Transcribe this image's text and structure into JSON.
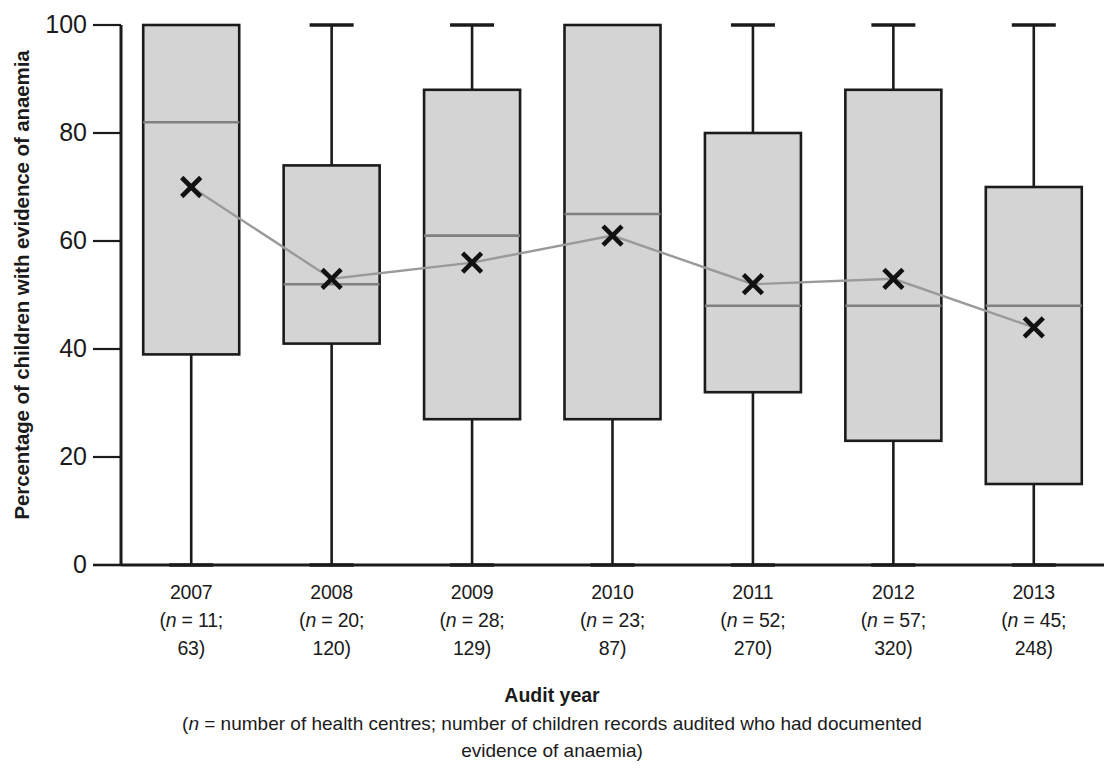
{
  "chart_data": {
    "type": "box",
    "title": "",
    "ylabel": "Percentage of children with evidence of anaemia",
    "xlabel": "Audit year",
    "xlabel_note_prefix": "(",
    "xlabel_note_italic": "n",
    "xlabel_note_rest": " = number of health centres; number of children records audited who had documented",
    "xlabel_note_line2": "evidence of anaemia)",
    "ylim": [
      0,
      100
    ],
    "yticks": [
      0,
      20,
      40,
      60,
      80,
      100
    ],
    "ytick_labels": [
      "0",
      "20",
      "40",
      "60",
      "80",
      "100"
    ],
    "grid": false,
    "legend": "none",
    "mean_marker": "x",
    "mean_line": true,
    "box_fill": "#d4d4d4",
    "box_stroke": "#1b1b1b",
    "median_color": "#808080",
    "mean_line_color": "#9a9a9a",
    "categories": [
      "2007",
      "2008",
      "2009",
      "2010",
      "2011",
      "2012",
      "2013"
    ],
    "n_health_centres": [
      11,
      20,
      28,
      23,
      52,
      57,
      45
    ],
    "n_child_records": [
      63,
      120,
      129,
      87,
      270,
      320,
      248
    ],
    "boxes": [
      {
        "year": "2007",
        "whisker_low": 0,
        "q1": 39,
        "median": 82,
        "q3": 100,
        "whisker_high": 100,
        "mean": 70
      },
      {
        "year": "2008",
        "whisker_low": 0,
        "q1": 41,
        "median": 52,
        "q3": 74,
        "whisker_high": 100,
        "mean": 53
      },
      {
        "year": "2009",
        "whisker_low": 0,
        "q1": 27,
        "median": 61,
        "q3": 88,
        "whisker_high": 100,
        "mean": 56
      },
      {
        "year": "2010",
        "whisker_low": 0,
        "q1": 27,
        "median": 65,
        "q3": 100,
        "whisker_high": 100,
        "mean": 61
      },
      {
        "year": "2011",
        "whisker_low": 0,
        "q1": 32,
        "median": 48,
        "q3": 80,
        "whisker_high": 100,
        "mean": 52
      },
      {
        "year": "2012",
        "whisker_low": 0,
        "q1": 23,
        "median": 48,
        "q3": 88,
        "whisker_high": 100,
        "mean": 53
      },
      {
        "year": "2013",
        "whisker_low": 0,
        "q1": 15,
        "median": 48,
        "q3": 70,
        "whisker_high": 100,
        "mean": 44
      }
    ],
    "xtick_labels": [
      {
        "year": "2007",
        "line2_pre": "(",
        "line2_italic": "n",
        "line2_post": " = 11;",
        "line3": "63)"
      },
      {
        "year": "2008",
        "line2_pre": "(",
        "line2_italic": "n",
        "line2_post": " = 20;",
        "line3": "120)"
      },
      {
        "year": "2009",
        "line2_pre": "(",
        "line2_italic": "n",
        "line2_post": " = 28;",
        "line3": "129)"
      },
      {
        "year": "2010",
        "line2_pre": "(",
        "line2_italic": "n",
        "line2_post": " = 23;",
        "line3": "87)"
      },
      {
        "year": "2011",
        "line2_pre": "(",
        "line2_italic": "n",
        "line2_post": " = 52;",
        "line3": "270)"
      },
      {
        "year": "2012",
        "line2_pre": "(",
        "line2_italic": "n",
        "line2_post": " = 57;",
        "line3": "320)"
      },
      {
        "year": "2013",
        "line2_pre": "(",
        "line2_italic": "n",
        "line2_post": " = 45;",
        "line3": "248)"
      }
    ]
  }
}
